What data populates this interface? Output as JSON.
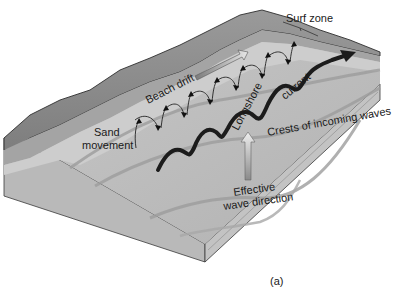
{
  "figure": {
    "caption": "(a)",
    "labels": {
      "surf_zone": "Surf zone",
      "beach_drift": "Beach drift",
      "sand_movement_line1": "Sand",
      "sand_movement_line2": "movement",
      "longshore": "Longshore",
      "current": "current",
      "crests": "Crests of incoming waves",
      "effective_line1": "Effective",
      "effective_line2": "wave direction"
    },
    "colors": {
      "background": "#ffffff",
      "land_dark": "#8e8e8e",
      "beach_mid": "#b4b4b4",
      "beach_light": "#cfcfcf",
      "water": "#bdbdbd",
      "water_band": "#a9a9a9",
      "block_side": "#b9b9b9",
      "outline": "#3a3a3a",
      "current_arrow": "#1c1c1c",
      "drift_arrow_fill": "#d8d8d8"
    }
  }
}
